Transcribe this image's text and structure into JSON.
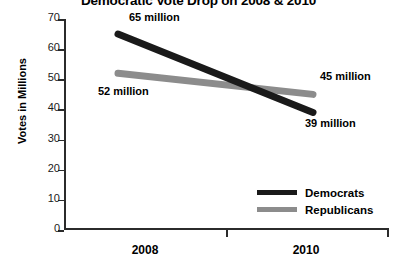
{
  "chart_data": {
    "type": "line",
    "title": "Democratic Vote Drop on 2008 & 2010",
    "xlabel": "",
    "ylabel": "Votes in Millions",
    "categories": [
      "2008",
      "2010"
    ],
    "x": [
      2008,
      2010
    ],
    "ylim": [
      0,
      70
    ],
    "yticks": [
      0,
      10,
      20,
      30,
      40,
      50,
      60,
      70
    ],
    "ytick_labels": [
      "0",
      "10",
      "20",
      "30",
      "40",
      "50",
      "60",
      "70"
    ],
    "grid": false,
    "legend_position": "bottom-right",
    "series": [
      {
        "name": "Democrats",
        "color": "#1a1a1a",
        "values": [
          65,
          39
        ],
        "labels": [
          "65 million",
          "39 million"
        ]
      },
      {
        "name": "Republicans",
        "color": "#8c8c8c",
        "values": [
          52,
          45
        ],
        "labels": [
          "52 million",
          "45 million"
        ]
      }
    ],
    "annotations": [
      {
        "text": "65 million",
        "value": 65,
        "series": "Democrats",
        "category": "2008"
      },
      {
        "text": "39 million",
        "value": 39,
        "series": "Democrats",
        "category": "2010"
      },
      {
        "text": "52 million",
        "value": 52,
        "series": "Republicans",
        "category": "2008"
      },
      {
        "text": "45 million",
        "value": 45,
        "series": "Republicans",
        "category": "2010"
      }
    ]
  },
  "legend": {
    "items": [
      {
        "label": "Democrats"
      },
      {
        "label": "Republicans"
      }
    ]
  },
  "axis": {
    "y_title": "Votes in Millions",
    "y_tick_labels": [
      "70",
      "60",
      "50",
      "40",
      "30",
      "20",
      "10",
      "0"
    ],
    "x_tick_labels": [
      "2008",
      "2010"
    ]
  }
}
